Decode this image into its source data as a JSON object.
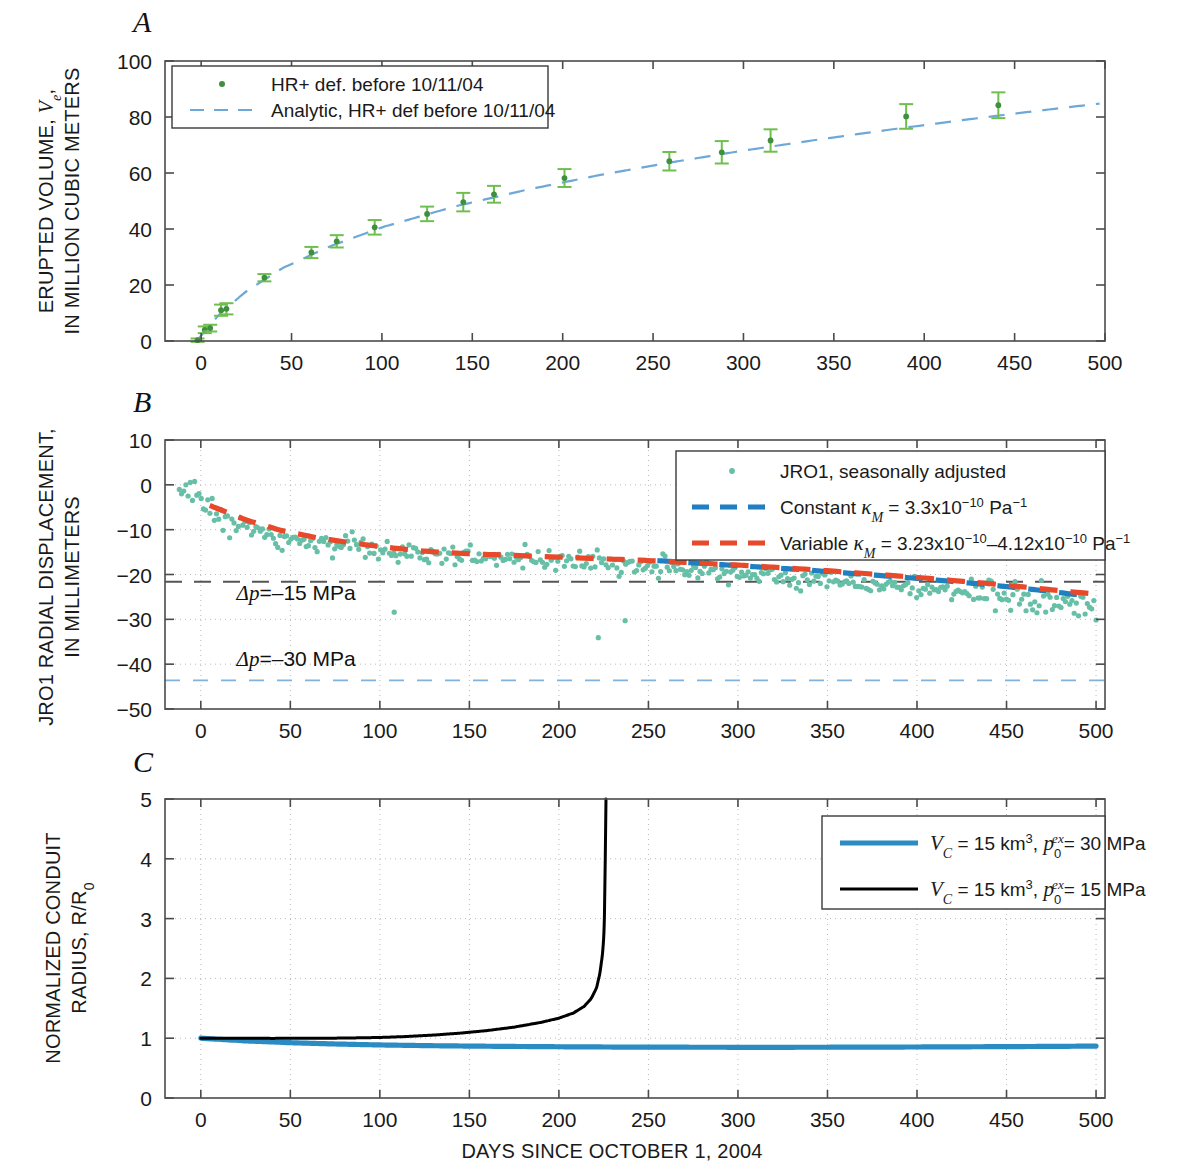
{
  "figure": {
    "xlabel": "DAYS SINCE OCTOBER 1, 2004",
    "panel_letters": [
      "A",
      "B",
      "C"
    ],
    "colors": {
      "green_marker": "#3f8f3f",
      "green_errorbar": "#6fbf4f",
      "analytic_blue": "#6ea8d8",
      "scatter_teal": "#66bfa6",
      "constant_blue": "#1f7fc0",
      "variable_red": "#e8492b",
      "dp15_gray": "#555555",
      "dp30_blue": "#7fb2dc",
      "conduit_blue": "#2b8cc4",
      "conduit_black": "#000000"
    }
  },
  "chart_data": [
    {
      "id": "panel-a",
      "type": "scatter",
      "panel": "A",
      "title": "",
      "xlabel": "",
      "ylabel": "ERUPTED VOLUME, Ve, IN MILLION CUBIC METERS",
      "ylabel_main": "ERUPTED VOLUME, ",
      "ylabel_sym": "V",
      "ylabel_sub": "e",
      "ylabel_line2": "IN MILLION CUBIC METERS",
      "xlim": [
        -20,
        500
      ],
      "ylim": [
        0,
        100
      ],
      "xticks": [
        0,
        50,
        100,
        150,
        200,
        250,
        300,
        350,
        400,
        450,
        500
      ],
      "xticklabels": [
        "0",
        "50",
        "100",
        "150",
        "200",
        "250",
        "300",
        "350",
        "400",
        "450",
        "500"
      ],
      "yticks": [
        0,
        20,
        40,
        60,
        80,
        100
      ],
      "yticklabels": [
        "0",
        "20",
        "40",
        "60",
        "80",
        "100"
      ],
      "grid": false,
      "legend_position": "upper-left",
      "legend": [
        {
          "label": "HR+ def. before 10/11/04",
          "style": "marker",
          "color": "#3f8f3f"
        },
        {
          "label": "Analytic, HR+ def before 10/11/04",
          "style": "dashed",
          "color": "#6ea8d8"
        }
      ],
      "points": [
        {
          "x": -2,
          "y": 0.3,
          "err": 0.6
        },
        {
          "x": 2,
          "y": 4.0,
          "err": 1.2
        },
        {
          "x": 5,
          "y": 4.6,
          "err": 1.2
        },
        {
          "x": 11,
          "y": 11.0,
          "err": 2.0
        },
        {
          "x": 14,
          "y": 11.5,
          "err": 2.0
        },
        {
          "x": 35,
          "y": 22.6,
          "err": 1.3
        },
        {
          "x": 61,
          "y": 31.6,
          "err": 2.0
        },
        {
          "x": 75,
          "y": 35.6,
          "err": 2.2
        },
        {
          "x": 96,
          "y": 40.6,
          "err": 2.6
        },
        {
          "x": 125,
          "y": 45.4,
          "err": 2.6
        },
        {
          "x": 145,
          "y": 49.6,
          "err": 3.3
        },
        {
          "x": 162,
          "y": 52.4,
          "err": 3.0
        },
        {
          "x": 201,
          "y": 58.2,
          "err": 3.2
        },
        {
          "x": 259,
          "y": 64.2,
          "err": 3.3
        },
        {
          "x": 288,
          "y": 67.4,
          "err": 4.0
        },
        {
          "x": 315,
          "y": 71.6,
          "err": 4.0
        },
        {
          "x": 390,
          "y": 80.2,
          "err": 4.4
        },
        {
          "x": 441,
          "y": 84.2,
          "err": 4.6
        }
      ],
      "analytic": {
        "label": "Analytic, HR+ def before 10/11/04",
        "x": [
          -2,
          10,
          25,
          45,
          70,
          100,
          140,
          180,
          220,
          260,
          300,
          340,
          380,
          420,
          460,
          497
        ],
        "y": [
          0.4,
          9.5,
          17.8,
          26.0,
          33.5,
          40.6,
          48.0,
          54.0,
          59.2,
          63.8,
          68.0,
          71.8,
          75.4,
          78.8,
          82.0,
          84.8
        ]
      }
    },
    {
      "id": "panel-b",
      "type": "scatter",
      "panel": "B",
      "title": "",
      "xlabel": "",
      "ylabel_line1": "JRO1 RADIAL DISPLACEMENT,",
      "ylabel_line2": "IN MILLIMETERS",
      "xlim": [
        -20,
        505
      ],
      "ylim": [
        -50,
        10
      ],
      "xticks": [
        0,
        50,
        100,
        150,
        200,
        250,
        300,
        350,
        400,
        450,
        500
      ],
      "xticklabels": [
        "0",
        "50",
        "100",
        "150",
        "200",
        "250",
        "300",
        "350",
        "400",
        "450",
        "500"
      ],
      "yticks": [
        -50,
        -40,
        -30,
        -20,
        -10,
        0,
        10
      ],
      "yticklabels": [
        "−50",
        "−40",
        "−30",
        "−20",
        "−10",
        "0",
        "10"
      ],
      "grid": true,
      "legend_position": "upper-right",
      "legend": [
        {
          "label": "JRO1, seasonally adjusted",
          "style": "marker",
          "color": "#66bfa6"
        },
        {
          "label_pre": "Constant ",
          "label_sym": "κ",
          "label_sub": "M",
          "label_post": " = 3.3x10",
          "label_exp": "−10",
          "label_tail": " Pa",
          "label_tail_exp": "−1",
          "style": "dashed-thick",
          "color": "#1f7fc0"
        },
        {
          "label_pre": "Variable ",
          "label_sym": "κ",
          "label_sub": "M",
          "label_post": " = 3.23x10",
          "label_exp": "−10",
          "label_mid": "–4.12x10",
          "label_exp2": "−10",
          "label_tail": " Pa",
          "label_tail_exp": "−1",
          "style": "dashed-thick",
          "color": "#e8492b"
        }
      ],
      "annotations": [
        {
          "text_pre": "Δp",
          "text_post": "=–15 MPa",
          "x": 20,
          "y": -25.6,
          "line_y": -21.6,
          "line_color": "#555555"
        },
        {
          "text_pre": "Δp",
          "text_post": "=–30 MPa",
          "x": 20,
          "y": -40.4,
          "line_y": -43.6,
          "line_color": "#7fb2dc"
        }
      ],
      "series": [
        {
          "name": "Constant kappa_M = 3.3x10^-10 Pa^-1",
          "color": "#1f7fc0",
          "x": [
            255,
            275,
            295,
            315,
            335,
            355,
            375,
            395,
            415,
            435,
            455,
            475,
            495
          ],
          "y": [
            -16.9,
            -17.4,
            -17.9,
            -18.4,
            -18.9,
            -19.5,
            -20.1,
            -20.7,
            -21.4,
            -22.1,
            -22.9,
            -23.8,
            -24.8
          ]
        },
        {
          "name": "Variable kappa_M = 3.23x10^-10 - 4.12x10^-10 Pa^-1",
          "color": "#e8492b",
          "x": [
            5,
            25,
            45,
            65,
            85,
            105,
            125,
            145,
            165,
            185,
            205,
            225,
            245,
            265,
            285,
            305,
            325,
            345,
            365,
            385,
            405,
            425,
            445,
            465,
            485,
            500
          ],
          "y": [
            -4.6,
            -7.8,
            -10.2,
            -11.8,
            -13.0,
            -14.0,
            -14.8,
            -15.3,
            -15.6,
            -15.9,
            -16.2,
            -16.5,
            -16.8,
            -17.2,
            -17.6,
            -18.0,
            -18.5,
            -19.0,
            -19.6,
            -20.2,
            -20.8,
            -21.5,
            -22.2,
            -23.0,
            -23.8,
            -24.4
          ]
        }
      ],
      "scatter": {
        "name": "JRO1, seasonally adjusted",
        "color": "#66bfa6",
        "trend_x": [
          -12,
          0,
          20,
          40,
          60,
          80,
          100,
          120,
          140,
          160,
          180,
          200,
          220,
          240,
          260,
          280,
          300,
          320,
          340,
          360,
          380,
          400,
          420,
          440,
          460,
          480,
          500
        ],
        "trend_y": [
          -1.0,
          -3.6,
          -8.6,
          -11.4,
          -12.8,
          -14.0,
          -14.8,
          -15.3,
          -15.6,
          -15.9,
          -16.3,
          -16.8,
          -17.3,
          -17.9,
          -18.5,
          -19.1,
          -19.8,
          -20.4,
          -21.0,
          -21.6,
          -22.3,
          -23.0,
          -23.8,
          -24.6,
          -25.5,
          -26.4,
          -27.4
        ],
        "n_points": 420,
        "scatter_sigma": 1.9,
        "outliers": [
          {
            "x": 108,
            "y": -28.4
          },
          {
            "x": 222,
            "y": -34.1
          },
          {
            "x": 237,
            "y": -30.3
          }
        ]
      }
    },
    {
      "id": "panel-c",
      "type": "line",
      "panel": "C",
      "title": "",
      "xlabel": "DAYS SINCE OCTOBER 1, 2004",
      "ylabel_line1": "NORMALIZED CONDUIT",
      "ylabel_line2_pre": "RADIUS, R/R",
      "ylabel_line2_sub": "0",
      "xlim": [
        -20,
        505
      ],
      "ylim": [
        0,
        5
      ],
      "xticks": [
        0,
        50,
        100,
        150,
        200,
        250,
        300,
        350,
        400,
        450,
        500
      ],
      "xticklabels": [
        "0",
        "50",
        "100",
        "150",
        "200",
        "250",
        "300",
        "350",
        "400",
        "450",
        "500"
      ],
      "yticks": [
        0,
        1,
        2,
        3,
        4,
        5
      ],
      "yticklabels": [
        "0",
        "1",
        "2",
        "3",
        "4",
        "5"
      ],
      "grid": true,
      "legend_position": "upper-right",
      "legend": [
        {
          "sym": "V",
          "sub": "C",
          "mid": " = 15 km",
          "sup": "3",
          "sep": ", ",
          "sym2": "p",
          "sub2": "0",
          "sup2": "ex",
          "tail": "= 30 MPa",
          "color": "#2b8cc4",
          "style": "solid-thick"
        },
        {
          "sym": "V",
          "sub": "C",
          "mid": " = 15 km",
          "sup": "3",
          "sep": ", ",
          "sym2": "p",
          "sub2": "0",
          "sup2": "ex",
          "tail": "= 15 MPa",
          "color": "#000000",
          "style": "solid-thick"
        }
      ],
      "series": [
        {
          "name": "VC = 15 km3, p0ex = 30 MPa",
          "color": "#2b8cc4",
          "x": [
            0,
            25,
            50,
            75,
            100,
            125,
            150,
            175,
            200,
            225,
            250,
            275,
            300,
            325,
            350,
            375,
            400,
            425,
            450,
            475,
            500
          ],
          "y": [
            1.0,
            0.955,
            0.925,
            0.903,
            0.887,
            0.876,
            0.868,
            0.862,
            0.857,
            0.853,
            0.85,
            0.849,
            0.848,
            0.848,
            0.849,
            0.851,
            0.853,
            0.856,
            0.859,
            0.863,
            0.868
          ]
        },
        {
          "name": "VC = 15 km3, p0ex = 15 MPa",
          "color": "#000000",
          "x": [
            0,
            20,
            40,
            60,
            80,
            100,
            115,
            130,
            145,
            160,
            175,
            190,
            200,
            208,
            214,
            218,
            221,
            223,
            224.5,
            225.5,
            226,
            226.3
          ],
          "y": [
            1.0,
            0.998,
            0.997,
            0.998,
            1.002,
            1.012,
            1.028,
            1.052,
            1.085,
            1.128,
            1.185,
            1.265,
            1.335,
            1.42,
            1.53,
            1.66,
            1.84,
            2.1,
            2.45,
            3.1,
            4.1,
            5.0
          ]
        }
      ]
    }
  ]
}
